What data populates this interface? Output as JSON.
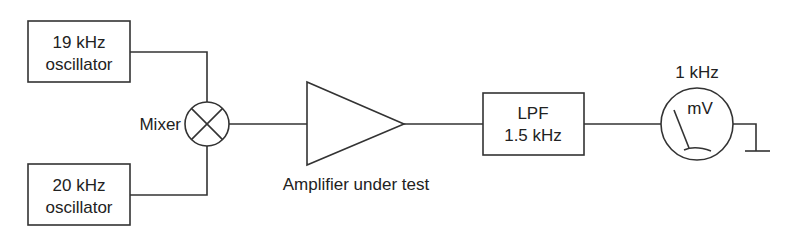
{
  "diagram": {
    "osc1": {
      "line1": "19 kHz",
      "line2": "oscillator"
    },
    "osc2": {
      "line1": "20 kHz",
      "line2": "oscillator"
    },
    "mixer": {
      "label": "Mixer"
    },
    "amplifier": {
      "label": "Amplifier under test"
    },
    "lpf": {
      "line1": "LPF",
      "line2": "1.5 kHz"
    },
    "meter": {
      "unit": "mV",
      "freq": "1 kHz"
    },
    "colors": {
      "stroke": "#333333",
      "text": "#222222"
    }
  }
}
